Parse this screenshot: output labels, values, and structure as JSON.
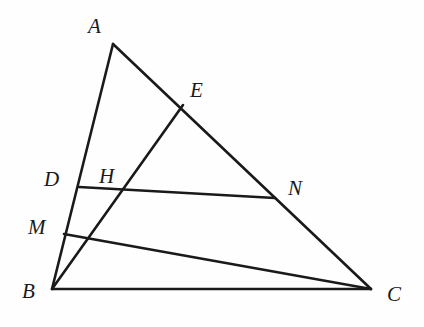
{
  "figure": {
    "type": "euclidean-geometry-diagram",
    "caption": "",
    "width": 424,
    "height": 327,
    "background_color": "#fefefe",
    "stroke_color": "#1a1a1a"
  },
  "points": {
    "A": {
      "label": "A",
      "x": 113,
      "y": 44,
      "label_x": 88,
      "label_y": 16
    },
    "B": {
      "label": "B",
      "x": 52,
      "y": 289,
      "label_x": 22,
      "label_y": 281
    },
    "C": {
      "label": "C",
      "x": 371,
      "y": 289,
      "label_x": 387,
      "label_y": 284
    },
    "D": {
      "label": "D",
      "x": 79,
      "y": 187,
      "label_x": 44,
      "label_y": 169
    },
    "E": {
      "label": "E",
      "x": 183,
      "y": 105,
      "label_x": 190,
      "label_y": 80
    },
    "H": {
      "label": "H",
      "x": 115,
      "y": 198,
      "label_x": 99,
      "label_y": 166
    },
    "M": {
      "label": "M",
      "x": 64,
      "y": 234,
      "label_x": 28,
      "label_y": 217
    },
    "N": {
      "label": "N",
      "x": 275,
      "y": 198,
      "label_x": 288,
      "label_y": 178
    }
  },
  "segments": [
    {
      "name": "side-AB",
      "from": "A",
      "to": "B",
      "width": 2.6
    },
    {
      "name": "side-AC",
      "from": "A",
      "to": "C",
      "width": 2.6
    },
    {
      "name": "side-BC",
      "from": "B",
      "to": "C",
      "width": 2.4
    },
    {
      "name": "cevian-BE",
      "from": "B",
      "to": "E",
      "width": 2.6
    },
    {
      "name": "segment-DN",
      "from": "D",
      "to": "N",
      "width": 2.6
    },
    {
      "name": "segment-MC",
      "from": "M",
      "to": "C",
      "width": 2.6
    }
  ],
  "labels_order": [
    "A",
    "E",
    "D",
    "H",
    "M",
    "N",
    "B",
    "C"
  ]
}
